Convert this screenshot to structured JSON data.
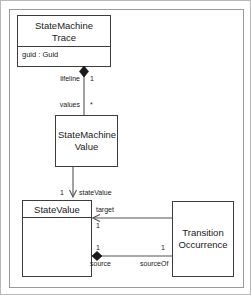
{
  "diagram": {
    "classes": [
      {
        "id": "statemachine-trace",
        "name_line1": "StateMachine",
        "name_line2": "Trace",
        "attributes": [
          "guid : Guid"
        ]
      },
      {
        "id": "statemachine-value",
        "name_line1": "StateMachine",
        "name_line2": "Value",
        "attributes": []
      },
      {
        "id": "state-value",
        "name_line1": "StateValue",
        "name_line2": "",
        "attributes": []
      },
      {
        "id": "transition-occurrence",
        "name_line1": "Transition",
        "name_line2": "Occurrence",
        "attributes": []
      }
    ],
    "associations": [
      {
        "id": "trace-to-value",
        "kind": "composition",
        "source_role": "lifeline",
        "source_multiplicity": "1",
        "target_role": "values",
        "target_multiplicity": "*"
      },
      {
        "id": "value-to-statevalue",
        "kind": "directed-association",
        "target_role": "stateValue",
        "source_multiplicity": "1"
      },
      {
        "id": "transition-target",
        "kind": "directed-association",
        "role": "target",
        "multiplicity": "1"
      },
      {
        "id": "transition-source",
        "kind": "composition",
        "source_role": "source",
        "source_multiplicity": "1",
        "target_role": "sourceOf",
        "target_multiplicity": "1"
      }
    ],
    "labels": {
      "lifeline": "lifeline",
      "lifeline_mult": "1",
      "values": "values",
      "values_mult": "*",
      "state_value_role": "stateValue",
      "state_value_mult": "1",
      "target": "target",
      "target_mult": "1",
      "source": "source",
      "source_mult": "1",
      "source_of": "sourceOf",
      "source_of_mult": "1"
    },
    "colors": {
      "class_border": "#3c3c3c",
      "edge": "#555555",
      "frame": "#9a9a9a",
      "text": "#1a1a1a",
      "background": "#ffffff"
    }
  }
}
